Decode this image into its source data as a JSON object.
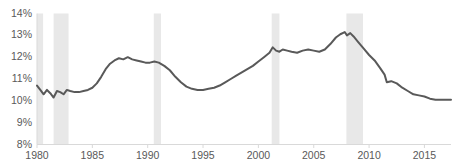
{
  "chart_data": {
    "type": "line",
    "title": "",
    "subtitle": "",
    "xlabel": "",
    "ylabel": "",
    "xlim": [
      1980,
      2017.4
    ],
    "ylim": [
      8,
      14
    ],
    "ytick_labels": [
      "14%",
      "13%",
      "12%",
      "11%",
      "10%",
      "9%",
      "8%"
    ],
    "ytick_values": [
      14,
      13,
      12,
      11,
      10,
      9,
      8
    ],
    "xtick_labels": [
      "1980",
      "1985",
      "1990",
      "1995",
      "2000",
      "2005",
      "2010",
      "2015"
    ],
    "xtick_values": [
      1980,
      1985,
      1990,
      1995,
      2000,
      2005,
      2010,
      2015
    ],
    "grid": false,
    "legend": "none",
    "line_color": "#595959",
    "line_width": 2,
    "axis_color": "#d9d9d9",
    "band_color": "#e8e8e8",
    "background": "#ffffff",
    "series": [
      {
        "name": "Series 1",
        "x": [
          1980.0,
          1980.3,
          1980.6,
          1980.9,
          1981.2,
          1981.5,
          1981.8,
          1982.1,
          1982.4,
          1982.7,
          1983.0,
          1983.4,
          1983.8,
          1984.2,
          1984.6,
          1985.0,
          1985.4,
          1985.8,
          1986.2,
          1986.6,
          1987.0,
          1987.4,
          1987.8,
          1988.2,
          1988.6,
          1989.0,
          1989.4,
          1989.8,
          1990.2,
          1990.6,
          1991.0,
          1991.5,
          1992.0,
          1992.5,
          1993.0,
          1993.5,
          1994.0,
          1994.5,
          1995.0,
          1995.5,
          1996.0,
          1996.5,
          1997.0,
          1997.5,
          1998.0,
          1998.5,
          1999.0,
          1999.5,
          2000.0,
          2000.5,
          2001.0,
          2001.3,
          2001.6,
          2001.9,
          2002.2,
          2002.6,
          2003.0,
          2003.5,
          2004.0,
          2004.5,
          2005.0,
          2005.5,
          2006.0,
          2006.5,
          2007.0,
          2007.4,
          2007.8,
          2008.0,
          2008.3,
          2008.6,
          2009.0,
          2009.5,
          2010.0,
          2010.5,
          2011.0,
          2011.4,
          2011.6,
          2012.0,
          2012.5,
          2013.0,
          2013.5,
          2014.0,
          2014.5,
          2015.0,
          2015.5,
          2016.0,
          2016.5,
          2017.0,
          2017.4
        ],
        "y": [
          10.7,
          10.5,
          10.3,
          10.5,
          10.35,
          10.15,
          10.45,
          10.4,
          10.3,
          10.5,
          10.45,
          10.4,
          10.4,
          10.45,
          10.5,
          10.6,
          10.8,
          11.1,
          11.45,
          11.7,
          11.85,
          11.95,
          11.9,
          12.0,
          11.9,
          11.85,
          11.8,
          11.75,
          11.75,
          11.8,
          11.75,
          11.6,
          11.4,
          11.1,
          10.85,
          10.65,
          10.55,
          10.5,
          10.5,
          10.55,
          10.6,
          10.7,
          10.85,
          11.0,
          11.15,
          11.3,
          11.45,
          11.6,
          11.8,
          12.0,
          12.2,
          12.45,
          12.3,
          12.25,
          12.35,
          12.3,
          12.25,
          12.2,
          12.3,
          12.35,
          12.3,
          12.25,
          12.35,
          12.6,
          12.9,
          13.05,
          13.15,
          13.0,
          13.1,
          12.95,
          12.7,
          12.4,
          12.1,
          11.85,
          11.5,
          11.2,
          10.85,
          10.9,
          10.8,
          10.6,
          10.45,
          10.3,
          10.25,
          10.2,
          10.1,
          10.05,
          10.05,
          10.05,
          10.05
        ]
      }
    ],
    "recession_bands": [
      {
        "start": 1980.0,
        "end": 1980.55
      },
      {
        "start": 1981.5,
        "end": 1982.85
      },
      {
        "start": 1990.55,
        "end": 1991.2
      },
      {
        "start": 2001.2,
        "end": 2001.9
      },
      {
        "start": 2007.95,
        "end": 2009.45
      }
    ]
  }
}
